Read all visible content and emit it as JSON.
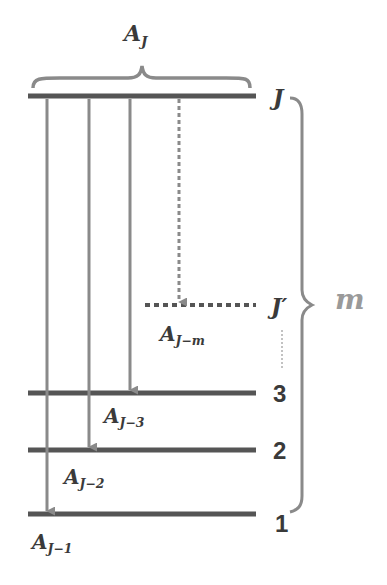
{
  "diagram": {
    "type": "energy-level-decay-scheme",
    "top_brace_label": {
      "base": "A",
      "sub": "J"
    },
    "side_brace_label": "m",
    "levels": [
      {
        "id": "J",
        "label": "J",
        "y": 96,
        "style": "solid"
      },
      {
        "id": "Jprime",
        "label": "J′",
        "y": 305,
        "style": "dotted"
      },
      {
        "id": "3",
        "label": "3",
        "y": 393,
        "style": "solid"
      },
      {
        "id": "2",
        "label": "2",
        "y": 450,
        "style": "solid"
      },
      {
        "id": "1",
        "label": "1",
        "y": 514,
        "style": "solid"
      }
    ],
    "transitions": [
      {
        "from": "J",
        "to": "1",
        "label_base": "A",
        "label_sub": "J−1",
        "style": "solid"
      },
      {
        "from": "J",
        "to": "2",
        "label_base": "A",
        "label_sub": "J−2",
        "style": "solid"
      },
      {
        "from": "J",
        "to": "3",
        "label_base": "A",
        "label_sub": "J−3",
        "style": "solid"
      },
      {
        "from": "J",
        "to": "Jprime",
        "label_base": "A",
        "label_sub": "J−m",
        "style": "dotted"
      }
    ],
    "colors": {
      "level_line": "#555555",
      "arrow": "#8a8a8a",
      "brace": "#8a8a8a",
      "text": "#3a3a3a",
      "m_label": "#9a9a9a"
    }
  }
}
